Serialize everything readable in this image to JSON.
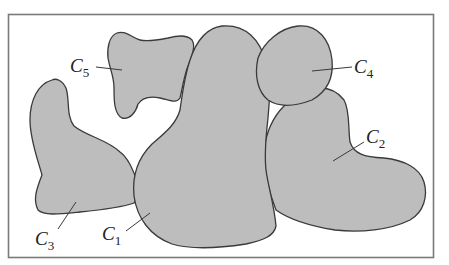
{
  "diagram": {
    "type": "region-cover",
    "colors": {
      "region_fill": "#bdbdbd",
      "region_stroke": "#3a3a3a",
      "frame_stroke": "#7a7a7a",
      "background": "#ffffff"
    },
    "regions": [
      {
        "id": "C1",
        "letter": "C",
        "subscript": "1"
      },
      {
        "id": "C2",
        "letter": "C",
        "subscript": "2"
      },
      {
        "id": "C3",
        "letter": "C",
        "subscript": "3"
      },
      {
        "id": "C4",
        "letter": "C",
        "subscript": "4"
      },
      {
        "id": "C5",
        "letter": "C",
        "subscript": "5"
      }
    ]
  }
}
